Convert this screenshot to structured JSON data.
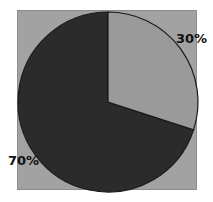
{
  "chart_data": {
    "type": "pie",
    "title": "",
    "subtitle": "",
    "xlabel": "",
    "ylabel": "",
    "grid": false,
    "legend": "none",
    "labels_position": "outside",
    "start_angle_deg": 0,
    "direction": "clockwise",
    "categories": [
      "30%",
      "70%"
    ],
    "values": [
      30,
      70
    ],
    "slices": [
      {
        "label": "30%",
        "value": 30,
        "fraction": 0.3,
        "color": "#9a9a9a",
        "edge_color": "#1a1a1a",
        "start_angle_deg": 0,
        "end_angle_deg": 108,
        "label_anchor": "upper-right"
      },
      {
        "label": "70%",
        "value": 70,
        "fraction": 0.7,
        "color": "#2b2b2b",
        "edge_color": "#1a1a1a",
        "start_angle_deg": 108,
        "end_angle_deg": 360,
        "label_anchor": "lower-left"
      }
    ],
    "annotations": [
      {
        "text": "30%",
        "x": 176,
        "y": 32
      },
      {
        "text": "70%",
        "x": 8,
        "y": 154
      }
    ],
    "geometry": {
      "center_x": 108,
      "center_y": 102,
      "radius": 90
    },
    "colors": {
      "figure_background": "#ffffff",
      "plot_background": "#a2a2a2",
      "plot_border": "#8d8d8d",
      "slice_light": "#9a9a9a",
      "slice_dark": "#2b2b2b",
      "outline": "#1a1a1a",
      "label_text": "#101010"
    }
  }
}
